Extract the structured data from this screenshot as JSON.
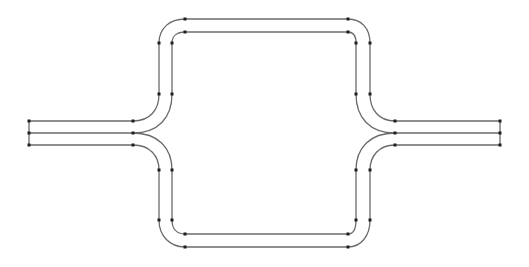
{
  "diagram": {
    "type": "track-layout",
    "colors": {
      "line": "#6a6a6a",
      "node": "#1e1e1e",
      "background": "#ffffff"
    },
    "left_terminal": {
      "x": 29,
      "ys": [
        121,
        133,
        145
      ]
    },
    "right_terminal": {
      "x": 500,
      "ys": [
        121,
        133,
        145
      ]
    },
    "left_junction_x": 133,
    "right_junction_x": 395,
    "outer_loop": {
      "left_x": 159,
      "right_x": 370,
      "top_y": 19,
      "bottom_y": 247
    },
    "inner_loop": {
      "left_x": 172,
      "right_x": 356,
      "top_y": 32,
      "bottom_y": 234
    },
    "nodes": [
      [
        29,
        121
      ],
      [
        29,
        133
      ],
      [
        29,
        145
      ],
      [
        133,
        121
      ],
      [
        133,
        133
      ],
      [
        133,
        145
      ],
      [
        159,
        43
      ],
      [
        172,
        43
      ],
      [
        159,
        94
      ],
      [
        172,
        94
      ],
      [
        159,
        170
      ],
      [
        172,
        170
      ],
      [
        159,
        220
      ],
      [
        172,
        220
      ],
      [
        185,
        19
      ],
      [
        185,
        32
      ],
      [
        185,
        234
      ],
      [
        185,
        247
      ],
      [
        348,
        19
      ],
      [
        348,
        32
      ],
      [
        348,
        234
      ],
      [
        348,
        247
      ],
      [
        356,
        43
      ],
      [
        370,
        43
      ],
      [
        356,
        94
      ],
      [
        370,
        94
      ],
      [
        356,
        170
      ],
      [
        370,
        170
      ],
      [
        356,
        220
      ],
      [
        370,
        220
      ],
      [
        395,
        121
      ],
      [
        395,
        133
      ],
      [
        395,
        145
      ],
      [
        500,
        121
      ],
      [
        500,
        133
      ],
      [
        500,
        145
      ]
    ]
  }
}
